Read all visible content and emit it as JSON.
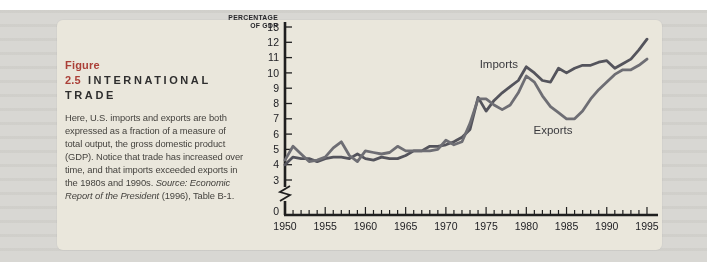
{
  "page": {
    "scan_background": "#d8d7d3",
    "panel_background": "#eae7dc",
    "accent_red": "#ab4038",
    "axis_color": "#1f1f1f",
    "text_color": "#45433f"
  },
  "figure": {
    "label": "Figure 2.5",
    "title": "INTERNATIONAL TRADE",
    "body": "Here, U.S. imports and exports are both expressed as a fraction of a measure of total output, the gross domestic product (GDP). Notice that trade has increased over time, and that imports exceeded exports in the 1980s and 1990s. ",
    "source_italic": "Source: Economic Report of the President",
    "source_rest": " (1996), Table B-1."
  },
  "chart_data": {
    "type": "line",
    "title": "",
    "xlabel": "",
    "ylabel": "PERCENTAGE OF GDP",
    "ylabel_lines": [
      "PERCENTAGE",
      "OF GDP"
    ],
    "xlim": [
      1950,
      1995
    ],
    "ylim": [
      0,
      13
    ],
    "axis_break_between": [
      0,
      3
    ],
    "grid": false,
    "legend_position": "inline-annotations",
    "yticks": [
      0,
      3,
      4,
      5,
      6,
      7,
      8,
      9,
      10,
      11,
      12,
      13
    ],
    "xticks_labeled": [
      1950,
      1955,
      1960,
      1965,
      1970,
      1975,
      1980,
      1985,
      1990,
      1995
    ],
    "xticks_minor_every": 1,
    "x": [
      1950,
      1951,
      1952,
      1953,
      1954,
      1955,
      1956,
      1957,
      1958,
      1959,
      1960,
      1961,
      1962,
      1963,
      1964,
      1965,
      1966,
      1967,
      1968,
      1969,
      1970,
      1971,
      1972,
      1973,
      1974,
      1975,
      1976,
      1977,
      1978,
      1979,
      1980,
      1981,
      1982,
      1983,
      1984,
      1985,
      1986,
      1987,
      1988,
      1989,
      1990,
      1991,
      1992,
      1993,
      1994,
      1995
    ],
    "series": [
      {
        "name": "Imports",
        "color": "#54545c",
        "values": [
          4.0,
          4.5,
          4.4,
          4.4,
          4.2,
          4.4,
          4.5,
          4.5,
          4.4,
          4.7,
          4.4,
          4.3,
          4.5,
          4.4,
          4.4,
          4.6,
          4.9,
          4.9,
          5.2,
          5.2,
          5.3,
          5.5,
          5.8,
          6.3,
          8.4,
          7.5,
          8.2,
          8.7,
          9.1,
          9.5,
          10.4,
          10.0,
          9.5,
          9.4,
          10.3,
          10.0,
          10.3,
          10.5,
          10.5,
          10.7,
          10.8,
          10.3,
          10.6,
          10.9,
          11.5,
          12.2
        ]
      },
      {
        "name": "Exports",
        "color": "#6e6e74",
        "values": [
          4.3,
          5.2,
          4.7,
          4.2,
          4.3,
          4.5,
          5.1,
          5.5,
          4.6,
          4.2,
          4.9,
          4.8,
          4.7,
          4.8,
          5.2,
          4.9,
          4.9,
          4.9,
          4.9,
          5.0,
          5.6,
          5.3,
          5.5,
          6.7,
          8.3,
          8.3,
          7.9,
          7.6,
          7.9,
          8.7,
          9.8,
          9.4,
          8.5,
          7.8,
          7.4,
          7.0,
          7.0,
          7.5,
          8.3,
          8.9,
          9.4,
          9.9,
          10.2,
          10.2,
          10.5,
          10.9
        ]
      }
    ],
    "annotations": [
      {
        "text": "Imports",
        "year": 1974.2,
        "value": 10.55
      },
      {
        "text": "Exports",
        "year": 1980.9,
        "value": 6.3
      }
    ],
    "origin_label": "0"
  }
}
